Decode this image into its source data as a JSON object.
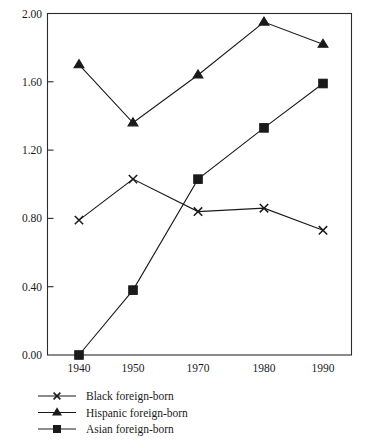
{
  "chart_data": {
    "type": "line",
    "title": "",
    "subtitle": "",
    "xlabel": "",
    "ylabel": "",
    "categories": [
      "1940",
      "1950",
      "1970",
      "1980",
      "1990"
    ],
    "ylim": [
      0.0,
      2.0
    ],
    "yticks": [
      "0.00",
      "0.40",
      "0.80",
      "1.20",
      "1.60",
      "2.00"
    ],
    "ytick_values": [
      0.0,
      0.4,
      0.8,
      1.2,
      1.6,
      2.0
    ],
    "grid": false,
    "legend_position": "below-left",
    "series": [
      {
        "name": "Black foreign-born",
        "marker": "x",
        "color": "#1a1a1a",
        "values": [
          0.79,
          1.03,
          0.84,
          0.86,
          0.73
        ]
      },
      {
        "name": "Hispanic foreign-born",
        "marker": "triangle",
        "color": "#1a1a1a",
        "values": [
          1.7,
          1.36,
          1.64,
          1.95,
          1.82
        ]
      },
      {
        "name": "Asian foreign-born",
        "marker": "square",
        "color": "#1a1a1a",
        "values": [
          0.0,
          0.38,
          1.03,
          1.33,
          1.59
        ]
      }
    ]
  },
  "axes": {
    "x_tick_labels": [
      "1940",
      "1950",
      "1970",
      "1980",
      "1990"
    ],
    "y_tick_labels": [
      "0.00",
      "0.40",
      "0.80",
      "1.20",
      "1.60",
      "2.00"
    ]
  },
  "legend": {
    "items": [
      {
        "label": "Black foreign-born",
        "marker": "x-marker"
      },
      {
        "label": "Hispanic foreign-born",
        "marker": "triangle-marker"
      },
      {
        "label": "Asian foreign-born",
        "marker": "square-marker"
      }
    ]
  },
  "colors": {
    "ink": "#1a1a1a",
    "frame": "#2b2b2b",
    "background": "#ffffff"
  }
}
